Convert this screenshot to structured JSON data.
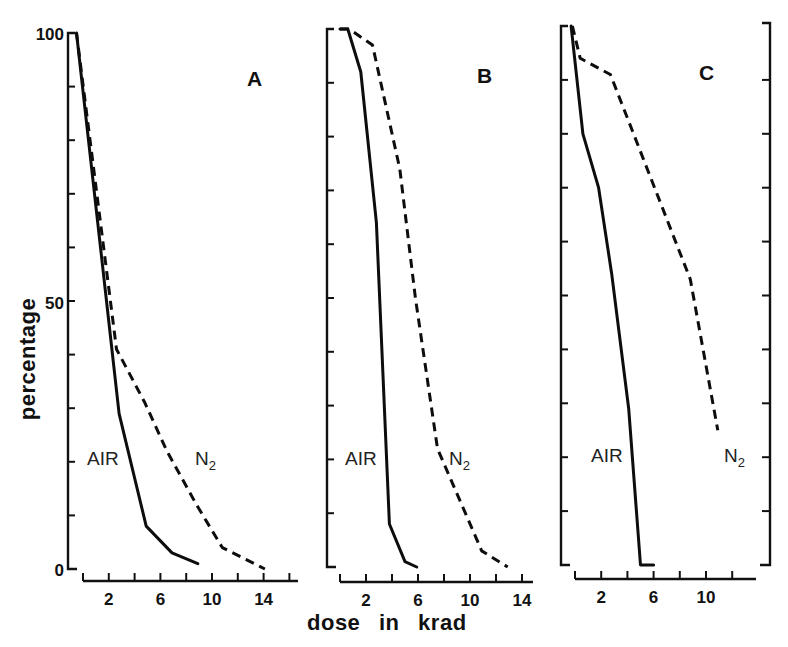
{
  "chart_data": {
    "type": "line",
    "xlabel": "dose in krad",
    "ylabel": "percentage",
    "ylim": [
      0,
      100
    ],
    "y_tick_labels": [
      "0",
      "50",
      "100"
    ],
    "grid": false,
    "legend": "inline labels (AIR solid, N2 dashed)",
    "panels": [
      {
        "label": "A",
        "xlim": [
          0,
          16
        ],
        "x_tick_labels": [
          "2",
          "6",
          "10",
          "14"
        ],
        "series": [
          {
            "name": "AIR",
            "style": "solid",
            "points": [
              [
                -0.5,
                100
              ],
              [
                2.8,
                29
              ],
              [
                4.9,
                8
              ],
              [
                6.9,
                3
              ],
              [
                8.9,
                1
              ]
            ]
          },
          {
            "name": "N2",
            "style": "dashed",
            "points": [
              [
                -0.5,
                100
              ],
              [
                2.6,
                41
              ],
              [
                4.8,
                31
              ],
              [
                6.5,
                22
              ],
              [
                8.8,
                12
              ],
              [
                10.8,
                4
              ],
              [
                14.1,
                0
              ]
            ]
          }
        ]
      },
      {
        "label": "B",
        "xlim": [
          0,
          14
        ],
        "x_tick_labels": [
          "2",
          "6",
          "10",
          "14"
        ],
        "series": [
          {
            "name": "AIR",
            "style": "solid",
            "points": [
              [
                0,
                100
              ],
              [
                0.6,
                100
              ],
              [
                1.6,
                92
              ],
              [
                2.8,
                64
              ],
              [
                3.8,
                8
              ],
              [
                5.0,
                1
              ],
              [
                5.9,
                0
              ]
            ]
          },
          {
            "name": "N2",
            "style": "dashed",
            "points": [
              [
                0,
                100
              ],
              [
                0.7,
                100
              ],
              [
                2.5,
                97
              ],
              [
                4.6,
                74
              ],
              [
                5.8,
                50
              ],
              [
                7.5,
                22
              ],
              [
                10.9,
                3
              ],
              [
                12.9,
                0
              ]
            ]
          }
        ]
      },
      {
        "label": "C",
        "xlim": [
          0,
          12
        ],
        "x_tick_labels": [
          "2",
          "6",
          "10"
        ],
        "series": [
          {
            "name": "AIR",
            "style": "solid",
            "points": [
              [
                -0.3,
                100
              ],
              [
                0.6,
                80
              ],
              [
                1.8,
                70
              ],
              [
                2.8,
                54
              ],
              [
                4.1,
                29
              ],
              [
                5.0,
                0
              ],
              [
                6.0,
                0
              ]
            ]
          },
          {
            "name": "N2",
            "style": "dashed",
            "points": [
              [
                -0.2,
                100
              ],
              [
                0.4,
                94
              ],
              [
                2.7,
                91
              ],
              [
                8.8,
                53
              ],
              [
                10.9,
                25
              ]
            ]
          }
        ]
      }
    ]
  },
  "labels": {
    "y_axis_title": "percentage",
    "x_axis_title": "dose in krad",
    "y_tick_100": "100",
    "y_tick_50": "50",
    "y_tick_0": "0",
    "panel_a": "A",
    "panel_b": "B",
    "panel_c": "C",
    "air": "AIR",
    "n2_main": "N",
    "n2_sub": "2"
  },
  "colors": {
    "ink": "#111111",
    "background": "#ffffff"
  }
}
